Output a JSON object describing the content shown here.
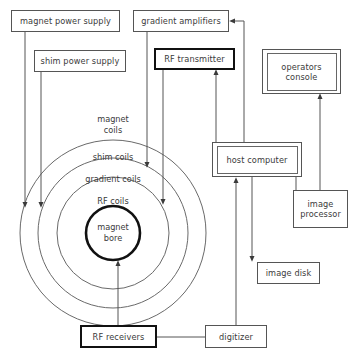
{
  "diagram": {
    "colors": {
      "line": "#555555",
      "thick_border": "#111111",
      "text": "#3b3b3b",
      "background": "#ffffff"
    },
    "nodes": {
      "magnet_power_supply": "magnet power supply",
      "shim_power_supply": "shim power supply",
      "gradient_amplifiers": "gradient amplifiers",
      "rf_transmitter": "RF transmitter",
      "operators_console": "operators\nconsole",
      "host_computer": "host computer",
      "image_processor": "image\nprocessor",
      "image_disk": "image disk",
      "rf_receivers": "RF receivers",
      "digitizer": "digitizer"
    },
    "ring_labels": {
      "magnet_coils": "magnet\ncoils",
      "shim_coils": "shim coils",
      "gradient_coils": "gradient coils",
      "rf_coils": "RF coils",
      "magnet_bore": "magnet\nbore"
    },
    "rings": [
      {
        "name": "magnet-coils-ring",
        "radius": 93
      },
      {
        "name": "shim-coils-ring",
        "radius": 75
      },
      {
        "name": "gradient-coils-ring",
        "radius": 56
      },
      {
        "name": "rf-coils-ring",
        "radius": 27
      }
    ],
    "connections": [
      "magnet power supply -> magnet coils",
      "shim power supply -> shim coils",
      "gradient amplifiers -> gradient coils",
      "RF transmitter -> RF coils",
      "host computer -> gradient amplifiers",
      "host computer -> RF transmitter",
      "host computer -> image disk",
      "host computer -> image processor",
      "image processor -> operators console",
      "magnet bore -> RF receivers",
      "RF receivers -> digitizer",
      "digitizer -> host computer"
    ]
  }
}
